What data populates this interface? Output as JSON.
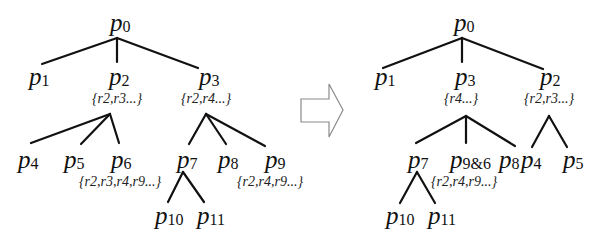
{
  "diagram": {
    "colors": {
      "edge": "#111111",
      "arrow_outline": "#8a8a8a",
      "background": "#ffffff"
    },
    "left_tree": {
      "nodes": {
        "p0": {
          "base": "p",
          "sub": "0"
        },
        "p1": {
          "base": "p",
          "sub": "1"
        },
        "p2": {
          "base": "p",
          "sub": "2"
        },
        "p3": {
          "base": "p",
          "sub": "3"
        },
        "p4": {
          "base": "p",
          "sub": "4"
        },
        "p5": {
          "base": "p",
          "sub": "5"
        },
        "p6": {
          "base": "p",
          "sub": "6"
        },
        "p7": {
          "base": "p",
          "sub": "7"
        },
        "p8": {
          "base": "p",
          "sub": "8"
        },
        "p9": {
          "base": "p",
          "sub": "9"
        },
        "p10": {
          "base": "p",
          "sub": "10"
        },
        "p11": {
          "base": "p",
          "sub": "11"
        }
      },
      "sets": {
        "p2": "{r2,r3...}",
        "p3": "{r2,r4...}",
        "p6": "{r2,r3,r4,r9...}",
        "p9": "{r2,r4,r9...}"
      },
      "edges": [
        [
          "p0",
          "p1"
        ],
        [
          "p0",
          "p2"
        ],
        [
          "p0",
          "p3"
        ],
        [
          "p2",
          "p4"
        ],
        [
          "p2",
          "p5"
        ],
        [
          "p2",
          "p6"
        ],
        [
          "p3",
          "p7"
        ],
        [
          "p3",
          "p8"
        ],
        [
          "p3",
          "p9"
        ],
        [
          "p7",
          "p10"
        ],
        [
          "p7",
          "p11"
        ]
      ]
    },
    "transform_arrow": {
      "direction": "right",
      "style": "outlined-block-arrow"
    },
    "right_tree": {
      "nodes": {
        "p0": {
          "base": "p",
          "sub": "0"
        },
        "p1": {
          "base": "p",
          "sub": "1"
        },
        "p3": {
          "base": "p",
          "sub": "3"
        },
        "p2": {
          "base": "p",
          "sub": "2"
        },
        "p7": {
          "base": "p",
          "sub": "7"
        },
        "p96": {
          "base": "p",
          "sub": "9&6"
        },
        "p8": {
          "base": "p",
          "sub": "8"
        },
        "p4": {
          "base": "p",
          "sub": "4"
        },
        "p5": {
          "base": "p",
          "sub": "5"
        },
        "p10": {
          "base": "p",
          "sub": "10"
        },
        "p11": {
          "base": "p",
          "sub": "11"
        }
      },
      "sets": {
        "p3": "{r4...}",
        "p2": "{r2,r3...}",
        "p96": "{r2,r4,r9...}"
      },
      "edges": [
        [
          "p0",
          "p1"
        ],
        [
          "p0",
          "p3"
        ],
        [
          "p0",
          "p2"
        ],
        [
          "p3",
          "p7"
        ],
        [
          "p3",
          "p9&6"
        ],
        [
          "p3",
          "p8"
        ],
        [
          "p2",
          "p4"
        ],
        [
          "p2",
          "p5"
        ],
        [
          "p7",
          "p10"
        ],
        [
          "p7",
          "p11"
        ]
      ]
    }
  }
}
